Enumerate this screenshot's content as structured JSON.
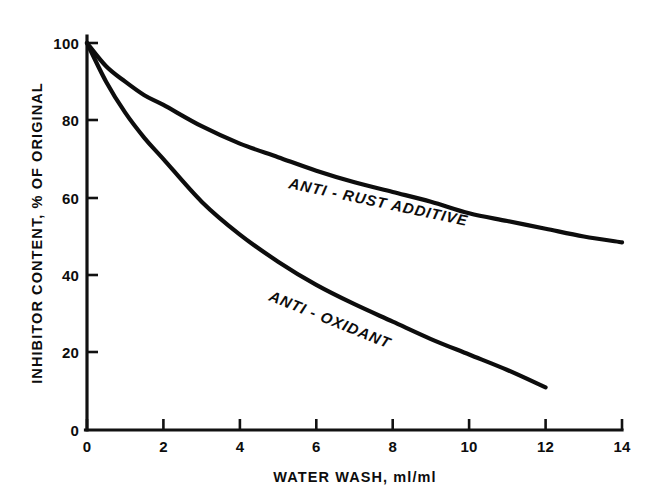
{
  "chart_data": {
    "type": "line",
    "title": "",
    "subtitle": "",
    "xlabel": "WATER WASH, ml/ml",
    "ylabel": "INHIBITOR CONTENT, % OF ORIGINAL",
    "xlim": [
      0,
      14
    ],
    "ylim": [
      0,
      100
    ],
    "xticks": [
      0,
      2,
      4,
      6,
      8,
      10,
      12,
      14
    ],
    "xticklabels": [
      "0",
      "2",
      "4",
      "6",
      "8",
      "10",
      "12",
      "14"
    ],
    "yticks": [
      0,
      20,
      40,
      60,
      80,
      100
    ],
    "yticklabels": [
      "0",
      "20",
      "40",
      "60",
      "80",
      "100"
    ],
    "grid": false,
    "legend_position": "inline-curve-labels",
    "line_color": "#0d0d0d",
    "background_color": "#ffffff",
    "series": [
      {
        "name": "ANTI - RUST ADDITIVE",
        "label_position": "above-curve",
        "x": [
          0,
          0.5,
          1,
          1.5,
          2,
          3,
          4,
          5,
          6,
          7,
          8,
          9,
          10,
          11,
          12,
          13,
          14
        ],
        "values": [
          100,
          94,
          90,
          86.5,
          84,
          78.5,
          74,
          70.5,
          67,
          64,
          61.5,
          59,
          56,
          54,
          52,
          50,
          48.5
        ]
      },
      {
        "name": "ANTI - OXIDANT",
        "label_position": "above-curve",
        "x": [
          0,
          0.5,
          1,
          1.5,
          2,
          3,
          4,
          5,
          6,
          7,
          8,
          9,
          10,
          11,
          12
        ],
        "values": [
          100,
          90,
          82,
          75.5,
          70,
          59,
          50.5,
          43.5,
          37.5,
          32.5,
          28,
          23.5,
          19.5,
          15.5,
          11
        ]
      }
    ]
  },
  "axis": {
    "x_title": "WATER WASH, ml/ml",
    "y_title": "INHIBITOR CONTENT, % OF ORIGINAL"
  },
  "curve_labels": {
    "anti_rust": "ANTI - RUST ADDITIVE",
    "anti_oxidant": "ANTI - OXIDANT"
  }
}
